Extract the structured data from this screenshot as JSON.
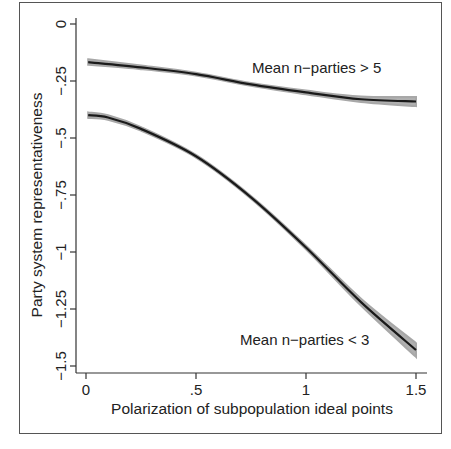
{
  "chart_data": {
    "type": "line",
    "title": "",
    "xlabel": "Polarization of subpopulation ideal points",
    "ylabel": "Party system representativeness",
    "xlim": [
      0,
      1.5
    ],
    "ylim": [
      -1.5,
      0
    ],
    "x_ticks": [
      0,
      0.5,
      1,
      1.5
    ],
    "x_tick_labels": [
      "0",
      ".5",
      "1",
      "1.5"
    ],
    "y_ticks": [
      0,
      -0.25,
      -0.5,
      -0.75,
      -1,
      -1.25,
      -1.5
    ],
    "y_tick_labels": [
      "0",
      "-.25",
      "-.5",
      "-.75",
      "-1",
      "-1.25",
      "-1.5"
    ],
    "grid": false,
    "legend": null,
    "confidence_bands": true,
    "series": [
      {
        "name": "Mean n-parties > 5",
        "x": [
          0.01,
          0.25,
          0.5,
          0.75,
          1.0,
          1.25,
          1.5
        ],
        "values": [
          -0.167,
          -0.19,
          -0.22,
          -0.265,
          -0.3,
          -0.33,
          -0.34
        ],
        "band_halfwidth": [
          0.012,
          0.008,
          0.006,
          0.006,
          0.008,
          0.012,
          0.02
        ]
      },
      {
        "name": "Mean n-parties < 3",
        "x": [
          0.01,
          0.1,
          0.25,
          0.5,
          0.75,
          1.0,
          1.25,
          1.5
        ],
        "values": [
          -0.4,
          -0.41,
          -0.46,
          -0.58,
          -0.76,
          -0.98,
          -1.22,
          -1.43
        ],
        "band_halfwidth": [
          0.012,
          0.01,
          0.008,
          0.006,
          0.006,
          0.008,
          0.015,
          0.03
        ]
      }
    ],
    "annotations": [
      {
        "text": "Mean n-parties > 5",
        "x": 1.1,
        "y": -0.24
      },
      {
        "text": "Mean n-parties < 3",
        "x": 1.07,
        "y": -1.36
      }
    ]
  },
  "labels": {
    "xlabel": "Polarization of subpopulation ideal points",
    "ylabel": "Party system representativeness",
    "annot_upper": "Mean n−parties > 5",
    "annot_lower": "Mean n−parties < 3",
    "xticks": [
      "0",
      ".5",
      "1",
      "1.5"
    ],
    "yticks": [
      "0",
      "−.25",
      "−.5",
      "−.75",
      "−1",
      "−1.25",
      "−1.5"
    ]
  }
}
